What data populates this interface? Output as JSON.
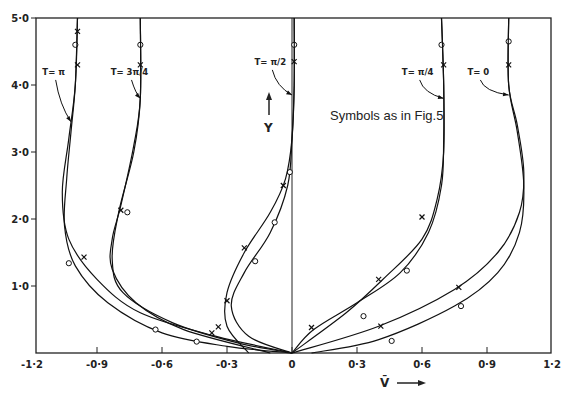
{
  "chart_data": {
    "type": "line",
    "title": "",
    "xlabel": "V̄",
    "ylabel": "Y",
    "xlim": [
      -1.2,
      1.2
    ],
    "ylim": [
      0,
      5.0
    ],
    "grid": false,
    "x_ticks": [
      -1.2,
      -0.9,
      -0.6,
      -0.3,
      0,
      0.3,
      0.6,
      0.9,
      1.2
    ],
    "x_tick_labels": [
      "-1·2",
      "-0·9",
      "-0·6",
      "-0·3",
      "0",
      "0·3",
      "0·6",
      "0·9",
      "1·2"
    ],
    "y_ticks": [
      1.0,
      2.0,
      3.0,
      4.0,
      5.0
    ],
    "y_tick_labels": [
      "1·0",
      "2·0",
      "3·0",
      "4·0",
      "5·0"
    ],
    "annotation": "Symbols as in Fig.5",
    "series": [
      {
        "name": "T=π (a)",
        "label": "T= π",
        "label_pos": [
          -1.1,
          4.15
        ],
        "arrow_to": [
          -1.02,
          3.45
        ],
        "points": [
          [
            0,
            0
          ],
          [
            -0.3,
            0.1
          ],
          [
            -0.6,
            0.3
          ],
          [
            -0.85,
            0.75
          ],
          [
            -1.0,
            1.3
          ],
          [
            -1.05,
            1.9
          ],
          [
            -1.04,
            2.6
          ],
          [
            -1.02,
            3.3
          ],
          [
            -1.0,
            4.0
          ],
          [
            -0.99,
            5.0
          ]
        ],
        "markers": [
          {
            "v": -1.0,
            "y": 4.6,
            "s": "o"
          },
          {
            "v": -1.03,
            "y": 1.34,
            "s": "o"
          },
          {
            "v": -0.63,
            "y": 0.35,
            "s": "o"
          },
          {
            "v": -0.44,
            "y": 0.17,
            "s": "o"
          }
        ]
      },
      {
        "name": "T=π (b)",
        "points": [
          [
            0,
            0
          ],
          [
            -0.35,
            0.25
          ],
          [
            -0.7,
            0.6
          ],
          [
            -0.9,
            1.1
          ],
          [
            -1.03,
            1.7
          ],
          [
            -1.06,
            2.4
          ],
          [
            -1.03,
            3.2
          ],
          [
            -1.0,
            4.0
          ],
          [
            -0.99,
            5.0
          ]
        ],
        "markers": [
          {
            "v": -0.99,
            "y": 4.8,
            "s": "x"
          },
          {
            "v": -0.99,
            "y": 4.3,
            "s": "x"
          },
          {
            "v": -0.96,
            "y": 1.43,
            "s": "x"
          },
          {
            "v": -0.34,
            "y": 0.39,
            "s": "x"
          },
          {
            "v": -0.37,
            "y": 0.3,
            "s": "x"
          }
        ]
      },
      {
        "name": "T=3π/4 (a)",
        "label": "T= 3π/4",
        "label_pos": [
          -0.75,
          4.15
        ],
        "arrow_to": [
          -0.7,
          3.8
        ],
        "points": [
          [
            0,
            0
          ],
          [
            -0.25,
            0.15
          ],
          [
            -0.55,
            0.45
          ],
          [
            -0.78,
            0.9
          ],
          [
            -0.83,
            1.4
          ],
          [
            -0.8,
            2.1
          ],
          [
            -0.73,
            3.0
          ],
          [
            -0.7,
            3.8
          ],
          [
            -0.7,
            5.0
          ]
        ],
        "markers": [
          {
            "v": -0.7,
            "y": 4.6,
            "s": "o"
          },
          {
            "v": -0.76,
            "y": 2.1,
            "s": "o"
          }
        ]
      },
      {
        "name": "T=3π/4 (b)",
        "points": [
          [
            -0.1,
            0
          ],
          [
            -0.5,
            0.35
          ],
          [
            -0.72,
            0.75
          ],
          [
            -0.83,
            1.25
          ],
          [
            -0.83,
            1.7
          ],
          [
            -0.79,
            2.2
          ],
          [
            -0.73,
            3.1
          ],
          [
            -0.7,
            3.8
          ],
          [
            -0.7,
            5.0
          ]
        ],
        "markers": [
          {
            "v": -0.7,
            "y": 4.3,
            "s": "x"
          },
          {
            "v": -0.79,
            "y": 2.13,
            "s": "x"
          }
        ]
      },
      {
        "name": "T=π/2 (a)",
        "label": "T= π/2",
        "label_pos": [
          -0.1,
          4.3
        ],
        "arrow_to": [
          0,
          3.85
        ],
        "points": [
          [
            0,
            0
          ],
          [
            -0.2,
            0.25
          ],
          [
            -0.28,
            0.7
          ],
          [
            -0.22,
            1.2
          ],
          [
            -0.1,
            1.8
          ],
          [
            -0.02,
            2.5
          ],
          [
            0,
            3.2
          ],
          [
            0.01,
            4.0
          ],
          [
            0.01,
            5.0
          ]
        ],
        "markers": [
          {
            "v": 0.01,
            "y": 4.6,
            "s": "o"
          },
          {
            "v": -0.17,
            "y": 1.37,
            "s": "o"
          },
          {
            "v": -0.08,
            "y": 1.95,
            "s": "o"
          },
          {
            "v": -0.01,
            "y": 2.7,
            "s": "o"
          }
        ]
      },
      {
        "name": "T=π/2 (b)",
        "points": [
          [
            -0.2,
            0
          ],
          [
            -0.3,
            0.4
          ],
          [
            -0.3,
            0.9
          ],
          [
            -0.22,
            1.5
          ],
          [
            -0.1,
            2.1
          ],
          [
            -0.03,
            2.6
          ],
          [
            0,
            3.2
          ],
          [
            0.01,
            4.0
          ],
          [
            0.01,
            5.0
          ]
        ],
        "markers": [
          {
            "v": 0.01,
            "y": 4.35,
            "s": "x"
          },
          {
            "v": -0.3,
            "y": 0.78,
            "s": "x"
          },
          {
            "v": -0.22,
            "y": 1.57,
            "s": "x"
          },
          {
            "v": -0.04,
            "y": 2.5,
            "s": "x"
          }
        ]
      },
      {
        "name": "T=π/4 (a)",
        "label": "T= π/4",
        "label_pos": [
          0.58,
          4.15
        ],
        "arrow_to": [
          0.7,
          3.8
        ],
        "points": [
          [
            0,
            0
          ],
          [
            0.1,
            0.35
          ],
          [
            0.3,
            0.75
          ],
          [
            0.5,
            1.2
          ],
          [
            0.63,
            1.8
          ],
          [
            0.69,
            2.5
          ],
          [
            0.7,
            3.2
          ],
          [
            0.7,
            4.0
          ],
          [
            0.69,
            5.0
          ]
        ],
        "markers": [
          {
            "v": 0.69,
            "y": 4.6,
            "s": "o"
          },
          {
            "v": 0.33,
            "y": 0.55,
            "s": "o"
          },
          {
            "v": 0.53,
            "y": 1.23,
            "s": "o"
          }
        ]
      },
      {
        "name": "T=π/4 (b)",
        "points": [
          [
            0,
            0
          ],
          [
            0.25,
            0.6
          ],
          [
            0.42,
            1.1
          ],
          [
            0.6,
            1.7
          ],
          [
            0.67,
            2.3
          ],
          [
            0.7,
            3.0
          ],
          [
            0.7,
            4.0
          ],
          [
            0.69,
            5.0
          ]
        ],
        "markers": [
          {
            "v": 0.7,
            "y": 4.3,
            "s": "x"
          },
          {
            "v": 0.09,
            "y": 0.38,
            "s": "x"
          },
          {
            "v": 0.4,
            "y": 1.1,
            "s": "x"
          },
          {
            "v": 0.6,
            "y": 2.03,
            "s": "x"
          }
        ]
      },
      {
        "name": "T=0 (a)",
        "label": "T= 0",
        "label_pos": [
          0.86,
          4.15
        ],
        "arrow_to": [
          1.0,
          3.85
        ],
        "points": [
          [
            0.09,
            0
          ],
          [
            0.4,
            0.2
          ],
          [
            0.75,
            0.7
          ],
          [
            0.95,
            1.2
          ],
          [
            1.05,
            1.8
          ],
          [
            1.07,
            2.5
          ],
          [
            1.04,
            3.3
          ],
          [
            1.0,
            4.0
          ],
          [
            1.0,
            5.0
          ]
        ],
        "markers": [
          {
            "v": 1.0,
            "y": 4.65,
            "s": "o"
          },
          {
            "v": 0.46,
            "y": 0.18,
            "s": "o"
          },
          {
            "v": 0.78,
            "y": 0.7,
            "s": "o"
          }
        ]
      },
      {
        "name": "T=0 (b)",
        "points": [
          [
            0,
            0
          ],
          [
            0.4,
            0.4
          ],
          [
            0.75,
            0.95
          ],
          [
            0.95,
            1.5
          ],
          [
            1.05,
            2.1
          ],
          [
            1.07,
            2.7
          ],
          [
            1.04,
            3.4
          ],
          [
            1.0,
            4.0
          ],
          [
            1.0,
            5.0
          ]
        ],
        "markers": [
          {
            "v": 1.0,
            "y": 4.3,
            "s": "x"
          },
          {
            "v": 0.41,
            "y": 0.4,
            "s": "x"
          },
          {
            "v": 0.77,
            "y": 0.98,
            "s": "x"
          }
        ]
      }
    ]
  }
}
